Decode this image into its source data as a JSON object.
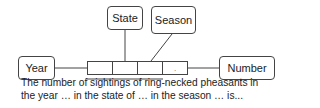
{
  "diagram": {
    "type": "relation-schema",
    "nodes": {
      "year": {
        "label": "Year"
      },
      "state": {
        "label": "State"
      },
      "season": {
        "label": "Season"
      },
      "number": {
        "label": "Number"
      }
    },
    "tuple_cells": [
      "",
      "",
      "",
      "."
    ],
    "edges": [
      {
        "from": "Year",
        "to": "tuple"
      },
      {
        "from": "State",
        "to": "tuple"
      },
      {
        "from": "Season",
        "to": "tuple"
      },
      {
        "from": "tuple",
        "to": "Number"
      }
    ],
    "caption": {
      "line1": "The number of sightings of ring-necked pheasants in",
      "line2": "the year … in the state of … in the season … is..."
    },
    "colors": {
      "stroke": "#444444",
      "text": "#222222",
      "background": "#ffffff"
    }
  }
}
